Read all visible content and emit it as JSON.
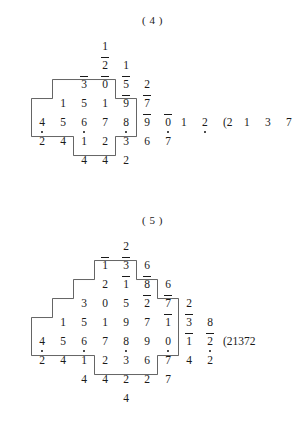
{
  "page": {
    "background": "#ffffff",
    "ink": "#1a1a1a"
  },
  "figures": [
    {
      "id": "figure-4",
      "caption": "( 4 )",
      "origin": {
        "x": 0,
        "y": 14
      },
      "cells": [
        {
          "col": 4,
          "row": 0,
          "digit": "1",
          "overline": false,
          "dot": false
        },
        {
          "col": 4,
          "row": 1,
          "digit": "2",
          "overline": true,
          "dot": false
        },
        {
          "col": 5,
          "row": 1,
          "digit": "1",
          "overline": false,
          "dot": false
        },
        {
          "col": 3,
          "row": 2,
          "digit": "3",
          "overline": true,
          "dot": false
        },
        {
          "col": 4,
          "row": 2,
          "digit": "0",
          "overline": true,
          "dot": false
        },
        {
          "col": 5,
          "row": 2,
          "digit": "5",
          "overline": true,
          "dot": false
        },
        {
          "col": 6,
          "row": 2,
          "digit": "2",
          "overline": false,
          "dot": false
        },
        {
          "col": 2,
          "row": 3,
          "digit": "1",
          "overline": false,
          "dot": false
        },
        {
          "col": 3,
          "row": 3,
          "digit": "5",
          "overline": false,
          "dot": false
        },
        {
          "col": 4,
          "row": 3,
          "digit": "1",
          "overline": false,
          "dot": false
        },
        {
          "col": 5,
          "row": 3,
          "digit": "9",
          "overline": true,
          "dot": false
        },
        {
          "col": 6,
          "row": 3,
          "digit": "7",
          "overline": true,
          "dot": false
        },
        {
          "col": 1,
          "row": 4,
          "digit": "4",
          "overline": false,
          "dot": true
        },
        {
          "col": 2,
          "row": 4,
          "digit": "5",
          "overline": false,
          "dot": false
        },
        {
          "col": 3,
          "row": 4,
          "digit": "6",
          "overline": false,
          "dot": true
        },
        {
          "col": 4,
          "row": 4,
          "digit": "7",
          "overline": false,
          "dot": false
        },
        {
          "col": 5,
          "row": 4,
          "digit": "8",
          "overline": false,
          "dot": true
        },
        {
          "col": 6,
          "row": 4,
          "digit": "9",
          "overline": true,
          "dot": false
        },
        {
          "col": 7,
          "row": 4,
          "digit": "0",
          "overline": true,
          "dot": true
        },
        {
          "col": 1,
          "row": 5,
          "digit": "2",
          "overline": false,
          "dot": false
        },
        {
          "col": 2,
          "row": 5,
          "digit": "4",
          "overline": false,
          "dot": false
        },
        {
          "col": 3,
          "row": 5,
          "digit": "1",
          "overline": false,
          "dot": false
        },
        {
          "col": 4,
          "row": 5,
          "digit": "2",
          "overline": false,
          "dot": false
        },
        {
          "col": 5,
          "row": 5,
          "digit": "3",
          "overline": false,
          "dot": false
        },
        {
          "col": 6,
          "row": 5,
          "digit": "6",
          "overline": false,
          "dot": false
        },
        {
          "col": 7,
          "row": 5,
          "digit": "7",
          "overline": false,
          "dot": false
        },
        {
          "col": 3,
          "row": 6,
          "digit": "4",
          "overline": false,
          "dot": false
        },
        {
          "col": 4,
          "row": 6,
          "digit": "4",
          "overline": false,
          "dot": false
        },
        {
          "col": 5,
          "row": 6,
          "digit": "2",
          "overline": false,
          "dot": false
        }
      ],
      "trailing": [
        {
          "col": 8,
          "row": 4,
          "text": "1",
          "dot": false
        },
        {
          "col": 9,
          "row": 4,
          "text": "2",
          "dot": true
        },
        {
          "col": 10,
          "row": 4,
          "text": "(2",
          "dot": false
        },
        {
          "col": 11,
          "row": 4,
          "text": "1",
          "dot": false
        },
        {
          "col": 12,
          "row": 4,
          "text": "3",
          "dot": false
        },
        {
          "col": 13,
          "row": 4,
          "text": "7",
          "dot": false
        }
      ],
      "outline": "M 1,3.6 L 2,3.6 L 2,2.6 L 5,2.6 L 5,3.6 L 6,3.6 L 6,5.6 L 5,5.6 L 5,6.6 L 3,6.6 L 3,5.6 L 1,5.6 Z"
    },
    {
      "id": "figure-5",
      "caption": "( 5 )",
      "origin": {
        "x": 0,
        "y": 214
      },
      "cells": [
        {
          "col": 5,
          "row": 0,
          "digit": "2",
          "overline": false,
          "dot": false
        },
        {
          "col": 4,
          "row": 1,
          "digit": "1",
          "overline": true,
          "dot": false
        },
        {
          "col": 5,
          "row": 1,
          "digit": "3",
          "overline": true,
          "dot": false
        },
        {
          "col": 6,
          "row": 1,
          "digit": "6",
          "overline": false,
          "dot": false
        },
        {
          "col": 4,
          "row": 2,
          "digit": "2",
          "overline": false,
          "dot": false
        },
        {
          "col": 5,
          "row": 2,
          "digit": "1",
          "overline": true,
          "dot": false
        },
        {
          "col": 6,
          "row": 2,
          "digit": "8",
          "overline": true,
          "dot": false
        },
        {
          "col": 7,
          "row": 2,
          "digit": "6",
          "overline": false,
          "dot": false
        },
        {
          "col": 3,
          "row": 3,
          "digit": "3",
          "overline": false,
          "dot": false
        },
        {
          "col": 4,
          "row": 3,
          "digit": "0",
          "overline": false,
          "dot": false
        },
        {
          "col": 5,
          "row": 3,
          "digit": "5",
          "overline": false,
          "dot": false
        },
        {
          "col": 6,
          "row": 3,
          "digit": "2",
          "overline": true,
          "dot": false
        },
        {
          "col": 7,
          "row": 3,
          "digit": "7",
          "overline": true,
          "dot": false
        },
        {
          "col": 8,
          "row": 3,
          "digit": "2",
          "overline": false,
          "dot": false
        },
        {
          "col": 2,
          "row": 4,
          "digit": "1",
          "overline": false,
          "dot": false
        },
        {
          "col": 3,
          "row": 4,
          "digit": "5",
          "overline": false,
          "dot": false
        },
        {
          "col": 4,
          "row": 4,
          "digit": "1",
          "overline": false,
          "dot": false
        },
        {
          "col": 5,
          "row": 4,
          "digit": "9",
          "overline": false,
          "dot": false
        },
        {
          "col": 6,
          "row": 4,
          "digit": "7",
          "overline": false,
          "dot": false
        },
        {
          "col": 7,
          "row": 4,
          "digit": "1",
          "overline": true,
          "dot": false
        },
        {
          "col": 8,
          "row": 4,
          "digit": "3",
          "overline": true,
          "dot": false
        },
        {
          "col": 9,
          "row": 4,
          "digit": "8",
          "overline": false,
          "dot": false
        },
        {
          "col": 1,
          "row": 5,
          "digit": "4",
          "overline": false,
          "dot": true
        },
        {
          "col": 2,
          "row": 5,
          "digit": "5",
          "overline": false,
          "dot": false
        },
        {
          "col": 3,
          "row": 5,
          "digit": "6",
          "overline": false,
          "dot": true
        },
        {
          "col": 4,
          "row": 5,
          "digit": "7",
          "overline": false,
          "dot": false
        },
        {
          "col": 5,
          "row": 5,
          "digit": "8",
          "overline": false,
          "dot": true
        },
        {
          "col": 6,
          "row": 5,
          "digit": "9",
          "overline": false,
          "dot": false
        },
        {
          "col": 7,
          "row": 5,
          "digit": "0",
          "overline": false,
          "dot": true
        },
        {
          "col": 8,
          "row": 5,
          "digit": "1",
          "overline": true,
          "dot": false
        },
        {
          "col": 9,
          "row": 5,
          "digit": "2",
          "overline": true,
          "dot": true
        },
        {
          "col": 1,
          "row": 6,
          "digit": "2",
          "overline": false,
          "dot": false
        },
        {
          "col": 2,
          "row": 6,
          "digit": "4",
          "overline": false,
          "dot": false
        },
        {
          "col": 3,
          "row": 6,
          "digit": "1",
          "overline": false,
          "dot": false
        },
        {
          "col": 4,
          "row": 6,
          "digit": "2",
          "overline": false,
          "dot": false
        },
        {
          "col": 5,
          "row": 6,
          "digit": "3",
          "overline": false,
          "dot": false
        },
        {
          "col": 6,
          "row": 6,
          "digit": "6",
          "overline": false,
          "dot": false
        },
        {
          "col": 7,
          "row": 6,
          "digit": "7",
          "overline": false,
          "dot": false
        },
        {
          "col": 8,
          "row": 6,
          "digit": "4",
          "overline": false,
          "dot": false
        },
        {
          "col": 9,
          "row": 6,
          "digit": "2",
          "overline": false,
          "dot": false
        },
        {
          "col": 3,
          "row": 7,
          "digit": "4",
          "overline": false,
          "dot": false
        },
        {
          "col": 4,
          "row": 7,
          "digit": "4",
          "overline": false,
          "dot": false
        },
        {
          "col": 5,
          "row": 7,
          "digit": "2",
          "overline": false,
          "dot": false
        },
        {
          "col": 6,
          "row": 7,
          "digit": "2",
          "overline": false,
          "dot": false
        },
        {
          "col": 7,
          "row": 7,
          "digit": "7",
          "overline": false,
          "dot": false
        },
        {
          "col": 5,
          "row": 8,
          "digit": "4",
          "overline": false,
          "dot": false
        }
      ],
      "trailing": [
        {
          "col": 10,
          "row": 5,
          "text": "(21372",
          "dot": false
        }
      ],
      "outline": "M 1,4.6 L 2,4.6 L 2,3.6 L 3,3.6 L 3,2.6 L 4,2.6 L 4,1.6 L 6,1.6 L 6,2.6 L 7,2.6 L 7,3.6 L 8,3.6 L 8,6.6 L 7,6.6 L 7,7.6 L 4,7.6 L 4,6.6 L 1,6.6 Z"
    }
  ]
}
